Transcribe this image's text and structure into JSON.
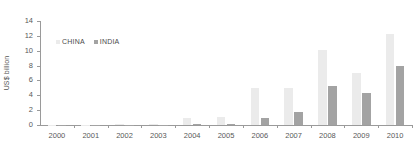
{
  "chart_data": {
    "type": "bar",
    "title": "",
    "subtitle": "",
    "xlabel": "",
    "ylabel": "US$ billion",
    "ylim": [
      0,
      14
    ],
    "ytick_step": 2,
    "yticks": [
      14,
      12,
      10,
      8,
      6,
      4,
      2,
      0
    ],
    "grid": false,
    "legend_position": "top-left-inside",
    "categories": [
      "2000",
      "2001",
      "2002",
      "2003",
      "2004",
      "2005",
      "2006",
      "2007",
      "2008",
      "2009",
      "2010"
    ],
    "series": [
      {
        "name": "CHINA",
        "color": "#ebebeb",
        "values": [
          0.05,
          0.05,
          0.1,
          0.15,
          0.9,
          1.1,
          5.0,
          5.0,
          10.1,
          7.0,
          12.2
        ]
      },
      {
        "name": "INDIA",
        "color": "#a3a3a3",
        "values": [
          0.02,
          0.02,
          0.03,
          0.05,
          0.1,
          0.15,
          1.0,
          1.7,
          5.3,
          4.3,
          8.0
        ]
      }
    ],
    "axis_color": "#9a9a9a",
    "tick_label_color": "#595959"
  },
  "legend": {
    "items": [
      {
        "label": "CHINA",
        "color": "#ebebeb"
      },
      {
        "label": "INDIA",
        "color": "#a3a3a3"
      }
    ]
  }
}
